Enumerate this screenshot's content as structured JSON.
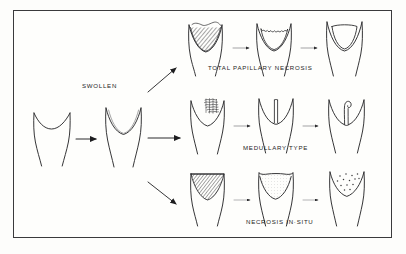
{
  "figure": {
    "kind": "medical-illustration",
    "frame_color": "#3a3a3c",
    "paper_color": "#fefefc",
    "ink_color": "#2b2b2d"
  },
  "labels": {
    "swollen": "SWOLLEN",
    "total_papillary_necrosis": "TOTAL  PAPILLARY  NECROSIS",
    "medullary_type": "MEDULLARY   TYPE",
    "necrosis_in_situ": "NECROSIS  IN·SITU"
  },
  "stages": {
    "normal": {
      "name": "normal papilla",
      "fill": "none"
    },
    "swollen": {
      "name": "swollen papilla",
      "fill": "none"
    }
  },
  "rows": [
    {
      "id": "total-papillary-necrosis",
      "label": "TOTAL  PAPILLARY  NECROSIS",
      "panels": [
        {
          "id": "tpn-1",
          "name": "hatched-necrotic-papilla-tip",
          "pattern": "diagonal-hatch"
        },
        {
          "id": "tpn-2",
          "name": "scalloped-cavity-papilla",
          "pattern": "scalloped-outline"
        },
        {
          "id": "tpn-3",
          "name": "smooth-cavity-papilla",
          "pattern": "smooth-outline"
        }
      ]
    },
    {
      "id": "medullary-type",
      "label": "MEDULLARY   TYPE",
      "panels": [
        {
          "id": "med-1",
          "name": "mottled-medullary-patch-papilla",
          "pattern": "dense-scribble"
        },
        {
          "id": "med-2",
          "name": "vertical-cleft-papilla",
          "pattern": "linear-cleft"
        },
        {
          "id": "med-3",
          "name": "bulbous-club-cavity-papilla",
          "pattern": "club-cavity"
        }
      ]
    },
    {
      "id": "necrosis-in-situ",
      "label": "NECROSIS  IN·SITU",
      "panels": [
        {
          "id": "nis-1",
          "name": "hatched-in-situ-papilla",
          "pattern": "diagonal-hatch"
        },
        {
          "id": "nis-2",
          "name": "light-crescent-papilla",
          "pattern": "light-stipple-crescent"
        },
        {
          "id": "nis-3",
          "name": "calcification-dots-papilla",
          "pattern": "scattered-dots"
        }
      ]
    }
  ],
  "arrows": {
    "normal_to_swollen": "straight-right",
    "swollen_to_top": "diagonal-up-right",
    "swollen_to_middle": "straight-right",
    "swollen_to_bottom": "diagonal-down-right",
    "between_panels": "short-right"
  }
}
